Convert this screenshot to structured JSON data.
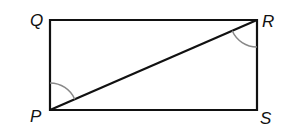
{
  "diagram": {
    "type": "rectangle-with-diagonal",
    "vertices": [
      {
        "label": "Q",
        "x": 50,
        "y": 20
      },
      {
        "label": "R",
        "x": 257,
        "y": 20
      },
      {
        "label": "S",
        "x": 257,
        "y": 110
      },
      {
        "label": "P",
        "x": 50,
        "y": 110
      }
    ],
    "diagonal": {
      "from": "P",
      "to": "R"
    },
    "angle_marks": [
      {
        "at": "P",
        "between": [
          "Q",
          "R"
        ],
        "label": "angle QPR"
      },
      {
        "at": "R",
        "between": [
          "P",
          "S"
        ],
        "label": "angle PRS"
      }
    ],
    "colors": {
      "line": "#111111",
      "angle_arc": "#888888"
    }
  },
  "labels": {
    "q": "Q",
    "r": "R",
    "s": "S",
    "p": "P"
  }
}
